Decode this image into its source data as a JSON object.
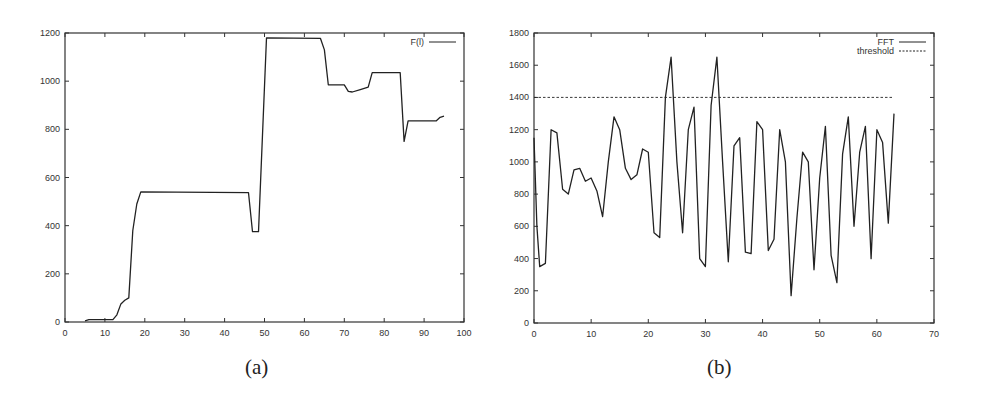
{
  "chart_data": [
    {
      "id": "a",
      "type": "line",
      "title": "",
      "caption": "(a)",
      "xlabel": "",
      "ylabel": "",
      "xlim": [
        0,
        100
      ],
      "ylim": [
        0,
        1200
      ],
      "xticks": [
        0,
        10,
        20,
        30,
        40,
        50,
        60,
        70,
        80,
        90,
        100
      ],
      "yticks": [
        0,
        200,
        400,
        600,
        800,
        1000,
        1200
      ],
      "grid": false,
      "legend_position": "top-right",
      "series": [
        {
          "name": "F(l)",
          "style": "solid",
          "x": [
            5,
            6,
            12,
            13,
            14,
            15,
            16,
            17,
            18,
            19,
            46,
            47,
            48.5,
            50.5,
            64,
            65,
            66,
            70,
            71,
            72,
            74,
            76,
            77,
            84,
            85,
            86,
            93,
            94,
            95
          ],
          "y": [
            5,
            10,
            10,
            30,
            75,
            90,
            100,
            380,
            490,
            540,
            537,
            375,
            375,
            1180,
            1178,
            1130,
            985,
            985,
            958,
            955,
            965,
            975,
            1035,
            1035,
            750,
            835,
            835,
            850,
            855
          ]
        }
      ]
    },
    {
      "id": "b",
      "type": "line",
      "title": "",
      "caption": "(b)",
      "xlabel": "",
      "ylabel": "",
      "xlim": [
        0,
        70
      ],
      "ylim": [
        0,
        1800
      ],
      "xticks": [
        0,
        10,
        20,
        30,
        40,
        50,
        60,
        70
      ],
      "yticks": [
        0,
        200,
        400,
        600,
        800,
        1000,
        1200,
        1400,
        1600,
        1800
      ],
      "grid": false,
      "legend_position": "top-right",
      "series": [
        {
          "name": "FFT",
          "style": "solid",
          "x": [
            0,
            0.5,
            1,
            2,
            3,
            4,
            5,
            6,
            7,
            8,
            9,
            10,
            11,
            12,
            13,
            14,
            15,
            16,
            17,
            18,
            19,
            20,
            21,
            22,
            23,
            24,
            25,
            26,
            27,
            28,
            29,
            30,
            31,
            32,
            33,
            34,
            35,
            36,
            37,
            38,
            39,
            40,
            41,
            42,
            43,
            44,
            45,
            46,
            47,
            48,
            49,
            50,
            51,
            52,
            53,
            54,
            55,
            56,
            57,
            58,
            59,
            60,
            61,
            62,
            63
          ],
          "y": [
            1150,
            600,
            350,
            370,
            1200,
            1180,
            830,
            800,
            950,
            960,
            880,
            900,
            820,
            660,
            1000,
            1280,
            1200,
            960,
            890,
            920,
            1080,
            1060,
            560,
            530,
            1400,
            1650,
            1000,
            560,
            1200,
            1340,
            400,
            350,
            1350,
            1650,
            1000,
            380,
            1100,
            1150,
            440,
            430,
            1250,
            1200,
            450,
            520,
            1200,
            1000,
            170,
            650,
            1060,
            1000,
            330,
            900,
            1220,
            420,
            250,
            1050,
            1280,
            600,
            1060,
            1220,
            400,
            1200,
            1120,
            620,
            1300
          ]
        },
        {
          "name": "threshold",
          "style": "dashed",
          "x": [
            0,
            63
          ],
          "y": [
            1400,
            1400
          ]
        }
      ]
    }
  ],
  "captions": {
    "a": "(a)",
    "b": "(b)"
  },
  "legends": {
    "a": [
      "F(l)"
    ],
    "b": [
      "FFT",
      "threshold"
    ]
  }
}
